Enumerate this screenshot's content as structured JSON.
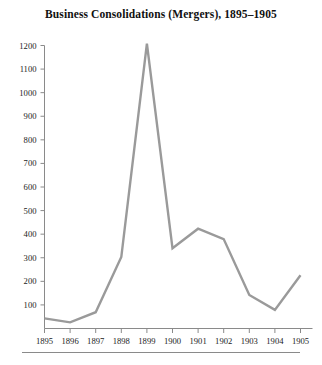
{
  "figure": {
    "title": "Business Consolidations (Mergers), 1895–1905",
    "line_color": "#9a9a9a",
    "axis_color": "#8a8a8a",
    "background": "#ffffff",
    "footer_rule": true
  },
  "chart_data": {
    "type": "line",
    "title": "Business Consolidations (Mergers), 1895–1905",
    "xlabel": "",
    "ylabel": "",
    "x": [
      1895,
      1896,
      1897,
      1898,
      1899,
      1900,
      1901,
      1902,
      1903,
      1904,
      1905
    ],
    "categories": [
      "1895",
      "1896",
      "1897",
      "1898",
      "1899",
      "1900",
      "1901",
      "1902",
      "1903",
      "1904",
      "1905"
    ],
    "values": [
      43,
      26,
      69,
      303,
      1208,
      340,
      423,
      379,
      142,
      79,
      226
    ],
    "series": [
      {
        "name": "Business consolidations (mergers)",
        "values": [
          43,
          26,
          69,
          303,
          1208,
          340,
          423,
          379,
          142,
          79,
          226
        ],
        "color": "#9a9a9a"
      }
    ],
    "xlim": [
      1895,
      1905
    ],
    "ylim": [
      0,
      1200
    ],
    "ytick_labels": [
      "100",
      "200",
      "300",
      "400",
      "500",
      "600",
      "700",
      "800",
      "900",
      "1000",
      "1100",
      "1200"
    ],
    "ytick_values": [
      100,
      200,
      300,
      400,
      500,
      600,
      700,
      800,
      900,
      1000,
      1100,
      1200
    ],
    "xtick_labels": [
      "1895",
      "1896",
      "1897",
      "1898",
      "1899",
      "1900",
      "1901",
      "1902",
      "1903",
      "1904",
      "1905"
    ],
    "grid": false,
    "legend": false,
    "legend_position": "none"
  }
}
